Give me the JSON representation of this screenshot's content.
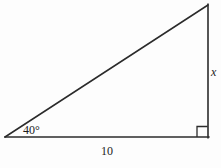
{
  "figure": {
    "name": "right-triangle-diagram",
    "background_color": "#fdfdfd",
    "stroke_color": "#2b2b2b",
    "width": 221,
    "height": 168,
    "labels": {
      "angle": "40°",
      "base": "10",
      "height": "x"
    },
    "watermark": "",
    "geometry": {
      "type": "right-triangle",
      "vertices": {
        "left": [
          5,
          137
        ],
        "apex": [
          208,
          5
        ],
        "right_corner": [
          208,
          137
        ]
      },
      "right_angle_marker": {
        "corner": [
          208,
          137
        ],
        "size": 11
      },
      "known_angle_at": "left",
      "known_angle_value": "40°",
      "known_side": "10",
      "unknown_side": "x"
    }
  }
}
